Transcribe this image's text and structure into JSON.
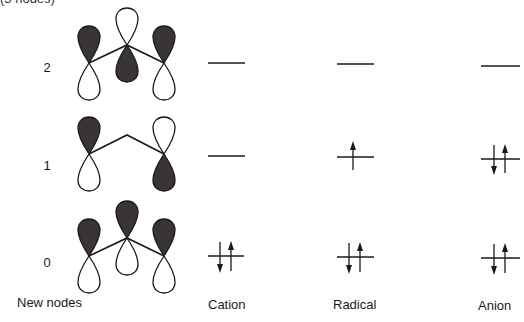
{
  "figure": {
    "cropped_title": "(3 nodes)",
    "x_axis_label": "New nodes",
    "columns": [
      {
        "id": "cation",
        "label": "Cation",
        "label_x": 208
      },
      {
        "id": "radical",
        "label": "Radical",
        "label_x": 333
      },
      {
        "id": "anion",
        "label": "Anion",
        "label_x": 478
      }
    ],
    "levels": [
      {
        "nodes": "2",
        "y": 63
      },
      {
        "nodes": "1",
        "y": 156
      },
      {
        "nodes": "0",
        "y": 256
      }
    ],
    "orbitals": [
      {
        "nodes": "2",
        "lobes": [
          {
            "atom": "left",
            "top": "dark",
            "bottom": "white"
          },
          {
            "atom": "center",
            "top": "white",
            "bottom": "dark"
          },
          {
            "atom": "right",
            "top": "dark",
            "bottom": "white"
          }
        ]
      },
      {
        "nodes": "1",
        "lobes": [
          {
            "atom": "left",
            "top": "dark",
            "bottom": "white"
          },
          {
            "atom": "center",
            "top": "none",
            "bottom": "none"
          },
          {
            "atom": "right",
            "top": "white",
            "bottom": "dark"
          }
        ]
      },
      {
        "nodes": "0",
        "lobes": [
          {
            "atom": "left",
            "top": "dark",
            "bottom": "white"
          },
          {
            "atom": "center",
            "top": "dark",
            "bottom": "white"
          },
          {
            "atom": "right",
            "top": "dark",
            "bottom": "white"
          }
        ]
      }
    ],
    "electron_occupancy": {
      "cation": {
        "level_2": 0,
        "level_1": 0,
        "level_0": 2
      },
      "radical": {
        "level_2": 0,
        "level_1": 1,
        "level_0": 2
      },
      "anion": {
        "level_2": 0,
        "level_1": 2,
        "level_0": 2
      }
    },
    "colors": {
      "dark_lobe": "#3a3434",
      "line": "#1a1a1a",
      "background": "#ffffff"
    }
  }
}
